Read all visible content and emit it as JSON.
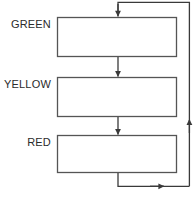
{
  "diagram": {
    "type": "flowchart",
    "canvas": {
      "width": 194,
      "height": 197,
      "background": "#ffffff"
    },
    "style": {
      "line_color": "#3a3a3a",
      "box_stroke": "#555555",
      "box_fill": "#ffffff",
      "text_color": "#2b2b2b",
      "stroke_width": 1.3
    },
    "nodes": [
      {
        "id": "green",
        "label": "GREEN",
        "shape": "rectangle",
        "x": 57,
        "y": 17,
        "width": 120,
        "height": 40
      },
      {
        "id": "yellow",
        "label": "YELLOW",
        "shape": "rectangle",
        "x": 57,
        "y": 77,
        "width": 120,
        "height": 40
      },
      {
        "id": "red",
        "label": "RED",
        "shape": "rectangle",
        "x": 57,
        "y": 135,
        "width": 120,
        "height": 38
      }
    ],
    "edges": [
      {
        "id": "edge-green-yellow",
        "from": "green",
        "to": "yellow",
        "arrow": "down"
      },
      {
        "id": "edge-yellow-red",
        "from": "yellow",
        "to": "red",
        "arrow": "down"
      },
      {
        "id": "edge-red-green-loop",
        "from": "red",
        "to": "green",
        "arrow": "loop-right"
      }
    ],
    "bottom_artifact": "...  ..  ."
  }
}
